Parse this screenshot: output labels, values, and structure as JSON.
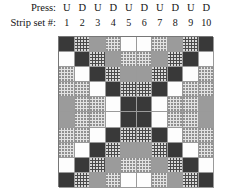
{
  "header": {
    "press_label": "Press:",
    "strip_label": "Strip set #:",
    "press_values": [
      "U",
      "D",
      "U",
      "D",
      "U",
      "D",
      "U",
      "D",
      "U",
      "D"
    ],
    "strip_numbers": [
      "1",
      "2",
      "3",
      "4",
      "5",
      "6",
      "7",
      "8",
      "9",
      "10"
    ]
  },
  "legend": {
    "fills": {
      "dark": "#393939",
      "dark_dotted": "#4a4a4a",
      "gray": "#9b9b9b",
      "light_dotted": "#e3e3e3",
      "white": "#fdfdfd"
    }
  },
  "chart_data": {
    "type": "heatmap",
    "title": "",
    "xlabel": "Strip set #",
    "ylabel": "",
    "columns": 10,
    "rows": 10,
    "categories": [
      "1",
      "2",
      "3",
      "4",
      "5",
      "6",
      "7",
      "8",
      "9",
      "10"
    ],
    "value_names": [
      "dark",
      "darkdot",
      "gray",
      "lightdot",
      "white"
    ],
    "grid": [
      [
        "dark",
        "darkdot",
        "gray",
        "lightdot",
        "white",
        "white",
        "lightdot",
        "gray",
        "darkdot",
        "dark"
      ],
      [
        "white",
        "dark",
        "darkdot",
        "gray",
        "lightdot",
        "lightdot",
        "gray",
        "darkdot",
        "dark",
        "white"
      ],
      [
        "lightdot",
        "white",
        "dark",
        "darkdot",
        "gray",
        "gray",
        "darkdot",
        "dark",
        "white",
        "lightdot"
      ],
      [
        "lightdot",
        "lightdot",
        "white",
        "dark",
        "darkdot",
        "darkdot",
        "dark",
        "white",
        "lightdot",
        "lightdot"
      ],
      [
        "gray",
        "lightdot",
        "lightdot",
        "white",
        "dark",
        "dark",
        "white",
        "lightdot",
        "lightdot",
        "gray"
      ],
      [
        "gray",
        "lightdot",
        "lightdot",
        "white",
        "dark",
        "dark",
        "white",
        "lightdot",
        "lightdot",
        "gray"
      ],
      [
        "lightdot",
        "lightdot",
        "white",
        "dark",
        "darkdot",
        "darkdot",
        "dark",
        "white",
        "lightdot",
        "lightdot"
      ],
      [
        "lightdot",
        "white",
        "dark",
        "darkdot",
        "gray",
        "gray",
        "darkdot",
        "dark",
        "white",
        "lightdot"
      ],
      [
        "white",
        "dark",
        "darkdot",
        "gray",
        "lightdot",
        "lightdot",
        "gray",
        "darkdot",
        "dark",
        "white"
      ],
      [
        "dark",
        "darkdot",
        "gray",
        "lightdot",
        "white",
        "white",
        "lightdot",
        "gray",
        "darkdot",
        "dark"
      ]
    ]
  }
}
